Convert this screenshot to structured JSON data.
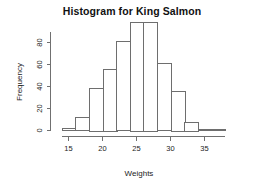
{
  "chart_data": {
    "type": "bar",
    "title": "Histogram for King Salmon",
    "xlabel": "Weights",
    "ylabel": "Frequency",
    "categories": [
      "14-16",
      "16-18",
      "18-20",
      "20-22",
      "22-24",
      "24-26",
      "26-28",
      "28-30",
      "30-32",
      "32-34",
      "34-36",
      "36-38"
    ],
    "bin_edges": [
      14,
      16,
      18,
      20,
      22,
      24,
      26,
      28,
      30,
      32,
      34,
      36,
      38
    ],
    "values": [
      2,
      12,
      39,
      56,
      81,
      99,
      99,
      61,
      36,
      8,
      1,
      1
    ],
    "bin_width": 2,
    "xlim": [
      14,
      38
    ],
    "ylim": [
      0,
      99
    ],
    "xticks": [
      15,
      20,
      25,
      30,
      35
    ],
    "yticks": [
      0,
      20,
      40,
      60,
      80
    ],
    "xtick_labels": [
      "15",
      "20",
      "25",
      "30",
      "35"
    ],
    "ytick_labels": [
      "0",
      "20",
      "40",
      "60",
      "80"
    ],
    "grid": false,
    "legend": false,
    "bar_fill": "#ffffff",
    "bar_stroke": "#6e6e6e",
    "axis_color": "#707070",
    "title_color": "#111111"
  }
}
